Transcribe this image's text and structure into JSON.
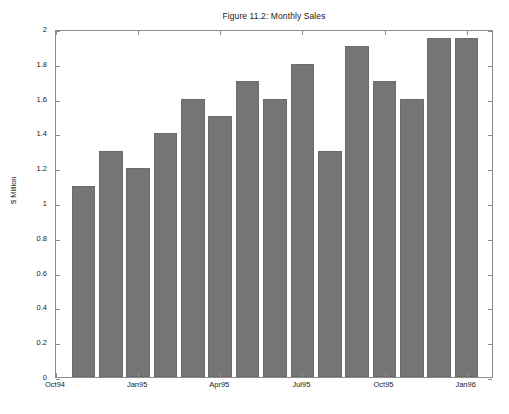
{
  "chart_data": {
    "type": "bar",
    "title": "Figure 11.2: Monthly Sales",
    "xlabel": "",
    "ylabel": "$ Million",
    "ylim": [
      0,
      2
    ],
    "ytick_step": 0.2,
    "grid": false,
    "legend": null,
    "bar_color": "#757575",
    "categories": [
      "Nov94",
      "Dec94",
      "Jan95",
      "Feb95",
      "Mar95",
      "Apr95",
      "May95",
      "Jun95",
      "Jul95",
      "Aug95",
      "Sep95",
      "Oct95",
      "Nov95",
      "Dec95",
      "Jan96"
    ],
    "values": [
      1.1,
      1.3,
      1.2,
      1.4,
      1.6,
      1.5,
      1.7,
      1.6,
      1.8,
      1.3,
      1.9,
      1.7,
      1.6,
      1.95,
      1.95
    ],
    "n_bars": 15,
    "ytick_labels": [
      "0",
      "0.2",
      "0.4",
      "0.6",
      "0.8",
      "1",
      "1.2",
      "1.4",
      "1.6",
      "1.8",
      "2"
    ],
    "ytick_values": [
      0,
      0.2,
      0.4,
      0.6,
      0.8,
      1,
      1.2,
      1.4,
      1.6,
      1.8,
      2
    ],
    "xtick_labels": [
      "Oct94",
      "Jan95",
      "Apr95",
      "Jul95",
      "Oct95",
      "Jan96"
    ],
    "xtick_positions": [
      0,
      3,
      6,
      9,
      12,
      15
    ]
  },
  "axes": {
    "y_title": "$ Million",
    "frame_color": "#8c8c8c"
  }
}
